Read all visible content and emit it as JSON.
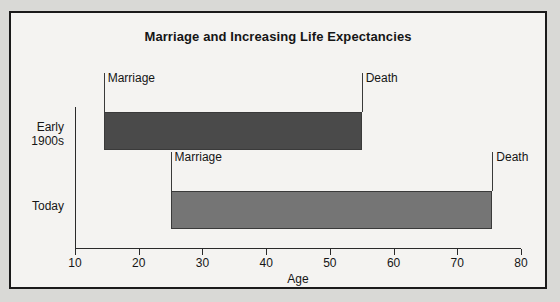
{
  "chart_data": {
    "type": "bar",
    "title": "Marriage and Increasing Life Expectancies",
    "xlabel": "Age",
    "ylabel": "",
    "xlim": [
      10,
      80
    ],
    "xticks": [
      10,
      20,
      30,
      40,
      50,
      60,
      70,
      80
    ],
    "xtick_labels": [
      "10",
      "20",
      "30",
      "40",
      "50",
      "60",
      "70",
      "80"
    ],
    "grid": false,
    "legend": "none",
    "orientation": "horizontal",
    "categories": [
      "Early\n1900s",
      "Today"
    ],
    "series": [
      {
        "name": "Life span from marriage to death",
        "bars": [
          {
            "category": "Early\n1900s",
            "start": 14.5,
            "end": 55,
            "start_label": "Marriage",
            "end_label": "Death",
            "color": "#4a4a4a"
          },
          {
            "category": "Today",
            "start": 25,
            "end": 75.5,
            "start_label": "Marriage",
            "end_label": "Death",
            "color": "#757575"
          }
        ]
      }
    ],
    "annotations": [
      {
        "text": "Marriage",
        "age": 14.5,
        "row": 0,
        "side": "left"
      },
      {
        "text": "Death",
        "age": 55,
        "row": 0,
        "side": "right"
      },
      {
        "text": "Marriage",
        "age": 25,
        "row": 1,
        "side": "left"
      },
      {
        "text": "Death",
        "age": 75.5,
        "row": 1,
        "side": "right"
      }
    ]
  },
  "figure": {
    "background": "#f4f3f1",
    "border_color": "#1a1a1a",
    "page_background": "#d9d9d6"
  }
}
